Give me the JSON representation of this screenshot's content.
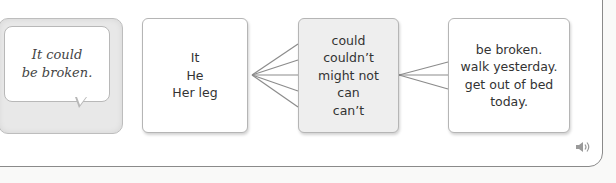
{
  "speech_bubble": {
    "text_line1": "It could",
    "text_line2": "be broken."
  },
  "column1": {
    "items": [
      "It",
      "He",
      "Her leg"
    ]
  },
  "column2": {
    "items": [
      "could",
      "couldn’t",
      "might not",
      "can",
      "can’t"
    ]
  },
  "column3": {
    "items": [
      "be broken.",
      "walk yesterday.",
      "get out of bed today."
    ]
  },
  "icons": {
    "audio": "speaker-icon"
  },
  "colors": {
    "border": "#8a8a8a",
    "box_border": "#b5b5b5",
    "highlight_box": "#eeeeee",
    "text": "#333333"
  }
}
